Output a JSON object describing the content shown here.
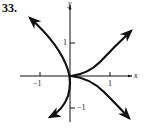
{
  "figure": {
    "problem_number": "33.",
    "axes": {
      "x_label": "x",
      "y_label": "y",
      "x_ticks": [
        {
          "value": -1,
          "label": "−1"
        },
        {
          "value": 1,
          "label": "1"
        }
      ],
      "y_ticks": [
        {
          "value": 1,
          "label": "1"
        },
        {
          "value": -1,
          "label": "−1"
        }
      ]
    },
    "curves": [
      {
        "name": "left-branch",
        "description": "curve through origin tangent to y-axis, opening left, arrows at both ends"
      },
      {
        "name": "right-cusp",
        "description": "two branches from cusp at origin heading upper-right and lower-right, arrows at ends"
      }
    ],
    "colors": {
      "stroke": "#111111",
      "background": "#ffffff"
    }
  }
}
